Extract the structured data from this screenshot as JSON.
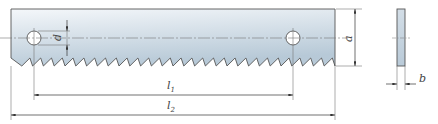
{
  "drawing": {
    "title": "Saw blade dimension drawing",
    "colors": {
      "stroke": "#555555",
      "dim": "#666666",
      "fill_top": "#f2f5f8",
      "fill_bottom": "#b9cad8",
      "side_fill": "#c3d2de"
    },
    "labels": {
      "hole_diameter": "d",
      "height": "a",
      "hole_spacing": "l",
      "hole_spacing_sub": "1",
      "total_length": "l",
      "total_length_sub": "2",
      "thickness": "b"
    },
    "blade": {
      "x_left": 11,
      "x_right": 335,
      "y_top": 9,
      "y_gullet": 58,
      "y_tip": 66,
      "tooth_pitch": 10.8
    },
    "holes": [
      {
        "cx": 34,
        "cy": 38,
        "r": 7
      },
      {
        "cx": 293,
        "cy": 38,
        "r": 7
      }
    ],
    "side_view": {
      "x": 397,
      "y": 9,
      "w": 8,
      "h": 57
    }
  }
}
